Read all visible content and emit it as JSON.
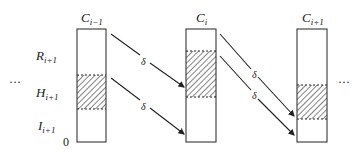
{
  "diagram": {
    "columns": [
      {
        "label": "C",
        "sub": "i−1",
        "hatch_top": 75,
        "hatch_bottom": 109
      },
      {
        "label": "C",
        "sub": "i",
        "hatch_top": 51,
        "hatch_bottom": 97
      },
      {
        "label": "C",
        "sub": "i+1",
        "hatch_top": 85,
        "hatch_bottom": 119
      }
    ],
    "row_labels": [
      {
        "label": "R",
        "sub": "i+1"
      },
      {
        "label": "H",
        "sub": "i+1"
      },
      {
        "label": "I",
        "sub": "i+1"
      }
    ],
    "origin_label": "0",
    "ellipsis_left": "···",
    "ellipsis_right": "···",
    "arrow_label": "δ"
  }
}
